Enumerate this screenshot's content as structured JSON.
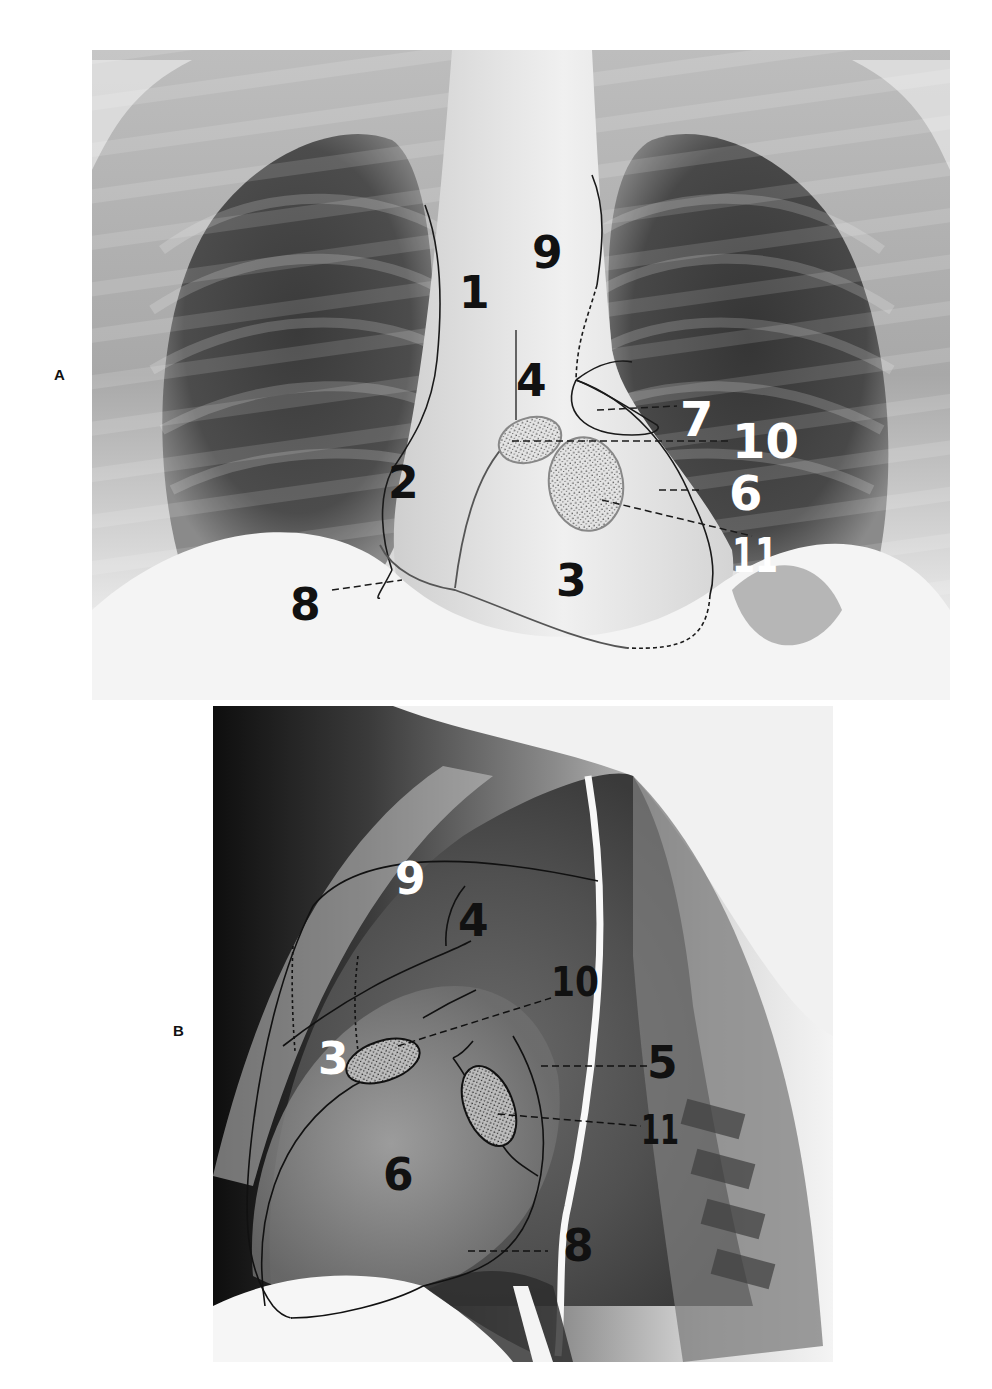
{
  "figure": {
    "panels": [
      {
        "id": "A",
        "letter": "A",
        "view": "frontal chest radiograph",
        "labels": {
          "l1": "1",
          "l2": "2",
          "l3": "3",
          "l4": "4",
          "l6": "6",
          "l7": "7",
          "l8": "8",
          "l9": "9",
          "l10": "10",
          "l11": "11"
        }
      },
      {
        "id": "B",
        "letter": "B",
        "view": "lateral chest radiograph",
        "labels": {
          "l3": "3",
          "l4": "4",
          "l5": "5",
          "l6": "6",
          "l8": "8",
          "l9": "9",
          "l10": "10",
          "l11": "11"
        }
      }
    ],
    "colors": {
      "background": "#ffffff",
      "outline": "#1a1a1a",
      "label_dark": "#111111",
      "label_light": "#ffffff",
      "stipple_fill": "#d8d8d8"
    }
  }
}
